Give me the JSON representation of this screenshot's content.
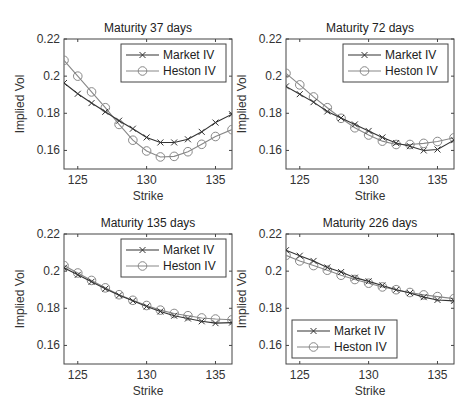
{
  "chart_data": [
    {
      "type": "line",
      "title": "Maturity 37 days",
      "xlabel": "Strike",
      "ylabel": "Implied Vol",
      "xlim": [
        124,
        136.2
      ],
      "ylim": [
        0.15,
        0.22
      ],
      "xticks": [
        125,
        130,
        135
      ],
      "yticks": [
        0.16,
        0.18,
        0.2,
        0.22
      ],
      "ytick_labels": [
        "0.16",
        "0.18",
        "0.2",
        "0.22"
      ],
      "legend_position": "top-right",
      "x": [
        124,
        125,
        126,
        127,
        128,
        129,
        130,
        131,
        132,
        133,
        134,
        135,
        136.2
      ],
      "series": [
        {
          "name": "Market IV",
          "marker": "x",
          "color": "#333333",
          "values": [
            0.1963,
            0.1905,
            0.1855,
            0.1808,
            0.176,
            0.1717,
            0.167,
            0.1643,
            0.1643,
            0.166,
            0.17,
            0.175,
            0.1795
          ]
        },
        {
          "name": "Heston IV",
          "marker": "o",
          "color": "#888888",
          "values": [
            0.2085,
            0.2,
            0.1915,
            0.183,
            0.174,
            0.1655,
            0.1597,
            0.1565,
            0.1568,
            0.1593,
            0.1633,
            0.1675,
            0.1712
          ]
        }
      ]
    },
    {
      "type": "line",
      "title": "Maturity 72 days",
      "xlabel": "Strike",
      "ylabel": "Implied Vol",
      "xlim": [
        124,
        136.2
      ],
      "ylim": [
        0.15,
        0.22
      ],
      "xticks": [
        125,
        130,
        135
      ],
      "yticks": [
        0.16,
        0.18,
        0.2,
        0.22
      ],
      "ytick_labels": [
        "0.16",
        "0.18",
        "0.2",
        "0.22"
      ],
      "legend_position": "top-right",
      "x": [
        124,
        125,
        126,
        127,
        128,
        129,
        130,
        131,
        132,
        133,
        134,
        135,
        136.2
      ],
      "series": [
        {
          "name": "Market IV",
          "marker": "x",
          "color": "#333333",
          "values": [
            0.1945,
            0.1903,
            0.186,
            0.181,
            0.1775,
            0.174,
            0.1705,
            0.167,
            0.164,
            0.1623,
            0.16,
            0.1605,
            0.1655
          ]
        },
        {
          "name": "Heston IV",
          "marker": "o",
          "color": "#888888",
          "values": [
            0.2015,
            0.1953,
            0.1888,
            0.183,
            0.1773,
            0.1722,
            0.1683,
            0.165,
            0.1632,
            0.1632,
            0.1638,
            0.1648,
            0.1668
          ]
        }
      ]
    },
    {
      "type": "line",
      "title": "Maturity 135 days",
      "xlabel": "Strike",
      "ylabel": "Implied Vol",
      "xlim": [
        124,
        136.2
      ],
      "ylim": [
        0.15,
        0.22
      ],
      "xticks": [
        125,
        130,
        135
      ],
      "yticks": [
        0.16,
        0.18,
        0.2,
        0.22
      ],
      "ytick_labels": [
        "0.16",
        "0.18",
        "0.2",
        "0.22"
      ],
      "legend_position": "top-right",
      "x": [
        124,
        125,
        126,
        127,
        128,
        129,
        130,
        131,
        132,
        133,
        134,
        135,
        136.2
      ],
      "series": [
        {
          "name": "Market IV",
          "marker": "x",
          "color": "#333333",
          "values": [
            0.2018,
            0.198,
            0.1943,
            0.1905,
            0.187,
            0.184,
            0.181,
            0.1783,
            0.176,
            0.1745,
            0.173,
            0.172,
            0.1723
          ]
        },
        {
          "name": "Heston IV",
          "marker": "o",
          "color": "#888888",
          "values": [
            0.203,
            0.199,
            0.195,
            0.191,
            0.1873,
            0.1843,
            0.1815,
            0.179,
            0.1772,
            0.176,
            0.1748,
            0.1742,
            0.1738
          ]
        }
      ]
    },
    {
      "type": "line",
      "title": "Maturity 226 days",
      "xlabel": "Strike",
      "ylabel": "Implied Vol",
      "xlim": [
        124,
        136.2
      ],
      "ylim": [
        0.15,
        0.22
      ],
      "xticks": [
        125,
        130,
        135
      ],
      "yticks": [
        0.16,
        0.18,
        0.2,
        0.22
      ],
      "ytick_labels": [
        "0.16",
        "0.18",
        "0.2",
        "0.22"
      ],
      "legend_position": "bottom-left",
      "x": [
        124,
        125,
        126,
        127,
        128,
        129,
        130,
        131,
        132,
        133,
        134,
        135,
        136.2
      ],
      "series": [
        {
          "name": "Market IV",
          "marker": "x",
          "color": "#333333",
          "values": [
            0.2113,
            0.2083,
            0.2055,
            0.202,
            0.1995,
            0.1965,
            0.1945,
            0.1923,
            0.19,
            0.1882,
            0.186,
            0.1845,
            0.184
          ]
        },
        {
          "name": "Heston IV",
          "marker": "o",
          "color": "#888888",
          "values": [
            0.2085,
            0.2055,
            0.203,
            0.2005,
            0.1978,
            0.1955,
            0.1935,
            0.1915,
            0.19,
            0.1885,
            0.1872,
            0.1863,
            0.1852
          ]
        }
      ]
    }
  ]
}
